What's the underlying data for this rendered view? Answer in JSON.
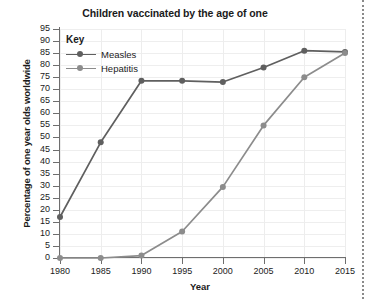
{
  "chart_data": {
    "type": "line",
    "title": "Children vaccinated by the age of one",
    "xlabel": "Year",
    "ylabel": "Percentage of one year olds worldwide",
    "x": [
      1980,
      1985,
      1990,
      1995,
      2000,
      2005,
      2010,
      2015
    ],
    "xtick_labels": [
      "1980",
      "1985",
      "1990",
      "1995",
      "2000",
      "2005",
      "2010",
      "2015"
    ],
    "ytick_labels": [
      "0",
      "5",
      "10",
      "15",
      "20",
      "25",
      "30",
      "35",
      "40",
      "45",
      "50",
      "55",
      "60",
      "65",
      "70",
      "75",
      "80",
      "85",
      "90",
      "95"
    ],
    "yticks": [
      0,
      5,
      10,
      15,
      20,
      25,
      30,
      35,
      40,
      45,
      50,
      55,
      60,
      65,
      70,
      75,
      80,
      85,
      90,
      95
    ],
    "ylim": [
      0,
      95
    ],
    "xlim": [
      1980,
      2015
    ],
    "grid": true,
    "legend_title": "Key",
    "legend_position": "top-left-inside",
    "series": [
      {
        "name": "Measles",
        "color": "#5f5f5f",
        "values": [
          17,
          48,
          73.5,
          73.5,
          73,
          79,
          86,
          85.5
        ]
      },
      {
        "name": "Hepatitis",
        "color": "#8c8c8c",
        "values": [
          0,
          0,
          1,
          11,
          29.5,
          55,
          75,
          85
        ]
      }
    ]
  },
  "colors": {
    "axis": "#6e6e6e",
    "grid": "#ededed",
    "text": "#1b1b1b",
    "measles": "#5f5f5f",
    "hepatitis": "#8c8c8c",
    "edge_dotted": "#8a8a8a"
  }
}
